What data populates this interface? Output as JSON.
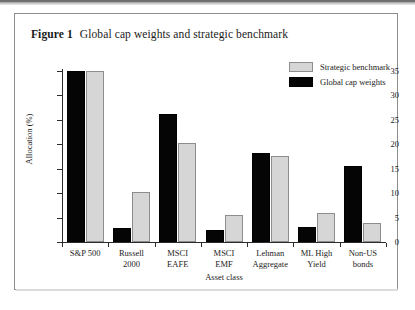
{
  "figure": {
    "label": "Figure 1",
    "title": "Global cap weights and strategic benchmark"
  },
  "legend": {
    "items": [
      {
        "label": "Strategic benchmark",
        "color": "#d6d6d6",
        "key": "strategic_benchmark"
      },
      {
        "label": "Global cap weights",
        "color": "#050505",
        "key": "global_cap_weights"
      }
    ]
  },
  "axes": {
    "y_ticks": [
      "0",
      "5",
      "10",
      "15",
      "20",
      "25",
      "30",
      "35"
    ],
    "y_title": "Allocation (%)",
    "x_title": "Asset class"
  },
  "chart_data": {
    "type": "bar",
    "title": "Global cap weights and strategic benchmark",
    "xlabel": "Asset class",
    "ylabel": "Allocation (%)",
    "ylim": [
      0,
      35
    ],
    "ytick_step": 5,
    "grid": false,
    "legend_position": "top-right",
    "categories": [
      "S&P 500",
      "Russell\n2000",
      "MSCI\nEAFE",
      "MSCI\nEMF",
      "Lehman\nAggregate",
      "ML High\nYield",
      "Non-US\nbonds"
    ],
    "series": [
      {
        "name": "Global cap weights",
        "color": "#050505",
        "values": [
          35.0,
          2.9,
          26.2,
          2.5,
          18.2,
          3.1,
          15.5
        ]
      },
      {
        "name": "Strategic benchmark",
        "color": "#d6d6d6",
        "values": [
          35.0,
          10.3,
          20.2,
          5.5,
          17.6,
          5.9,
          3.9
        ]
      }
    ]
  }
}
